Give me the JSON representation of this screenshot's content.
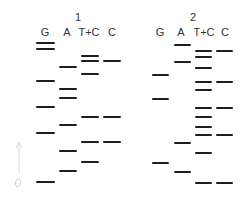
{
  "figure": {
    "type": "DNA sequencing gel (Maxam-Gilbert)",
    "band_color": "#1e1e1e",
    "gels": [
      {
        "number": "1",
        "number_x": 78,
        "lanes": [
          {
            "label": "G",
            "x": 45,
            "band_x": 36,
            "band_w": 19,
            "bands_y": [
              43,
              49,
              81,
              107,
              133,
              182
            ]
          },
          {
            "label": "A",
            "x": 67,
            "band_x": 59,
            "band_w": 18,
            "bands_y": [
              67,
              89,
              98,
              125,
              151,
              171
            ]
          },
          {
            "label": "T+C",
            "x": 89,
            "band_x": 81,
            "band_w": 18,
            "bands_y": [
              56,
              61,
              74,
              117,
              142,
              162
            ]
          },
          {
            "label": "C",
            "x": 112,
            "band_x": 103,
            "band_w": 18,
            "bands_y": [
              61,
              117,
              142
            ]
          }
        ]
      },
      {
        "number": "2",
        "number_x": 193,
        "lanes": [
          {
            "label": "G",
            "x": 160,
            "band_x": 152,
            "band_w": 17,
            "bands_y": [
              75,
              99,
              163
            ]
          },
          {
            "label": "A",
            "x": 181,
            "band_x": 174,
            "band_w": 17,
            "bands_y": [
              45,
              62,
              143,
              172
            ]
          },
          {
            "label": "T+C",
            "x": 204,
            "band_x": 195,
            "band_w": 17,
            "bands_y": [
              51,
              57,
              68,
              82,
              90,
              108,
              117,
              127,
              135,
              153,
              183
            ]
          },
          {
            "label": "C",
            "x": 225,
            "band_x": 216,
            "band_w": 17,
            "bands_y": [
              51,
              82,
              108,
              135,
              183
            ]
          }
        ]
      }
    ]
  }
}
